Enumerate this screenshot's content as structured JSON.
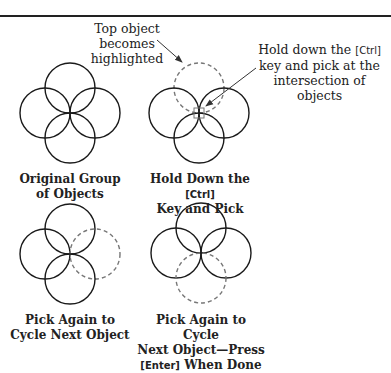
{
  "callouts": {
    "top_object": {
      "line1": "Top object becomes",
      "line2": "highlighted"
    },
    "hold_ctrl": {
      "line1_pre": "Hold down the ",
      "line1_key": "[Ctrl]",
      "line2": "key and pick at the",
      "line3": "intersection of objects"
    }
  },
  "panels": [
    {
      "id": "original",
      "line1": "Original Group",
      "line2": "of Objects",
      "highlighted": null
    },
    {
      "id": "hold-ctrl",
      "line1_pre": "Hold Down the ",
      "line1_key": "[Ctrl]",
      "line2": "Key and Pick",
      "highlighted": "top"
    },
    {
      "id": "pick-again",
      "line1": "Pick Again to",
      "line2": "Cycle Next Object",
      "highlighted": "right"
    },
    {
      "id": "pick-again-done",
      "line1": "Pick Again to Cycle",
      "line2": "Next Object—Press",
      "line3_key": "[Enter]",
      "line3_post": " When Done",
      "highlighted": "bottom"
    }
  ],
  "colors": {
    "solid": "#1a1a1a",
    "dashed": "#777777",
    "rule": "#222222"
  }
}
